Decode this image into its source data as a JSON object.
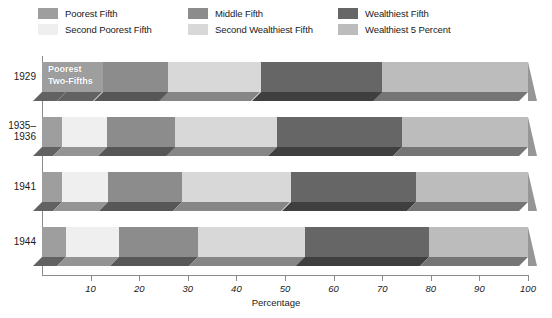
{
  "chart_data": {
    "type": "bar",
    "orientation": "horizontal",
    "stacked": true,
    "title": "",
    "xlabel": "Percentage",
    "ylabel": "",
    "xlim": [
      0,
      100
    ],
    "xticks": [
      0,
      10,
      20,
      30,
      40,
      50,
      60,
      70,
      80,
      90,
      100
    ],
    "xtick_labels": [
      "",
      "10",
      "20",
      "30",
      "40",
      "50",
      "60",
      "70",
      "80",
      "90",
      "100"
    ],
    "grid": false,
    "legend_position": "top",
    "categories": [
      "1929",
      "1935–\n1936",
      "1941",
      "1944"
    ],
    "series": [
      {
        "name": "Poorest Fifth",
        "color": "#9e9e9e",
        "values": [
          5.0,
          4.1,
          4.1,
          4.9
        ]
      },
      {
        "name": "Second Poorest Fifth",
        "color": "#efefef",
        "values": [
          7.5,
          9.2,
          9.5,
          10.9
        ]
      },
      {
        "name": "Middle Fifth",
        "color": "#8c8c8c",
        "values": [
          13.5,
          14.1,
          15.3,
          16.2
        ]
      },
      {
        "name": "Second Wealthiest Fifth",
        "color": "#d8d8d8",
        "values": [
          19.0,
          20.9,
          22.3,
          22.2
        ]
      },
      {
        "name": "Wealthiest Fifth",
        "color": "#666666",
        "values": [
          25.0,
          25.7,
          25.8,
          25.5
        ]
      },
      {
        "name": "Wealthiest 5 Percent",
        "color": "#bcbcbc",
        "values": [
          30.0,
          26.0,
          23.0,
          20.3
        ]
      }
    ],
    "annotations": [
      {
        "text": "Poorest\nTwo-Fifths",
        "row": "1929",
        "spans_series": [
          "Poorest Fifth",
          "Second Poorest Fifth"
        ]
      }
    ]
  },
  "legend": {
    "items": [
      {
        "label": "Poorest Fifth",
        "color": "#9e9e9e",
        "col": 0,
        "row": 0
      },
      {
        "label": "Second Poorest Fifth",
        "color": "#efefef",
        "col": 0,
        "row": 1
      },
      {
        "label": "Middle Fifth",
        "color": "#8c8c8c",
        "col": 1,
        "row": 0
      },
      {
        "label": "Second Wealthiest Fifth",
        "color": "#d8d8d8",
        "col": 1,
        "row": 1
      },
      {
        "label": "Wealthiest Fifth",
        "color": "#666666",
        "col": 2,
        "row": 0
      },
      {
        "label": "Wealthiest 5 Percent",
        "color": "#bcbcbc",
        "col": 2,
        "row": 1
      }
    ]
  },
  "axis": {
    "title": "Percentage",
    "tick_labels": [
      "10",
      "20",
      "30",
      "40",
      "50",
      "60",
      "70",
      "80",
      "90",
      "100"
    ],
    "tick_values": [
      10,
      20,
      30,
      40,
      50,
      60,
      70,
      80,
      90,
      100
    ]
  },
  "rows": [
    {
      "label_lines": [
        "1929"
      ],
      "top": 0
    },
    {
      "label_lines": [
        "1935–",
        "1936"
      ],
      "top": 55
    },
    {
      "label_lines": [
        "1941"
      ],
      "top": 110
    },
    {
      "label_lines": [
        "1944"
      ],
      "top": 165
    }
  ],
  "annotation": {
    "line1": "Poorest",
    "line2": "Two-Fifths"
  },
  "colors": {
    "axis": "#8a8a8a",
    "text": "#1a1a1a",
    "background": "#ffffff"
  }
}
